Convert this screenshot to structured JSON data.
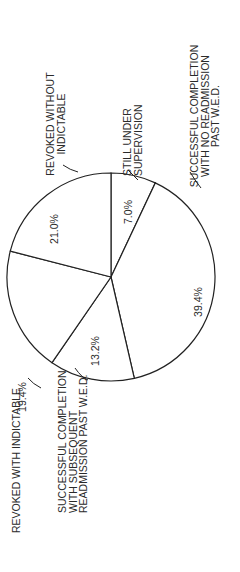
{
  "chart_data": {
    "type": "pie",
    "title": "",
    "orientation": "rotated 90 degrees counter-clockwise",
    "slices": [
      {
        "label_lines": [
          "STILL UNDER",
          "SUPERVISION"
        ],
        "value": 7.0,
        "value_label": "7.0%"
      },
      {
        "label_lines": [
          "SUCCESSFUL COMPLETION",
          "WITH NO READMISSION",
          "PAST W.E.D."
        ],
        "value": 39.4,
        "value_label": "39.4%"
      },
      {
        "label_lines": [
          "SUCCESSFUL COMPLETION",
          "WITH SUBSEQUENT",
          "READMISSION PAST W.E.D."
        ],
        "value": 13.2,
        "value_label": "13.2%"
      },
      {
        "label_lines": [
          "REVOKED WITH INDICTABLE"
        ],
        "value": 19.4,
        "value_label": "19.4%"
      },
      {
        "label_lines": [
          "REVOKED WITHOUT",
          "INDICTABLE"
        ],
        "value": 21.0,
        "value_label": "21.0%"
      }
    ],
    "legend": "none",
    "units": "percent"
  }
}
